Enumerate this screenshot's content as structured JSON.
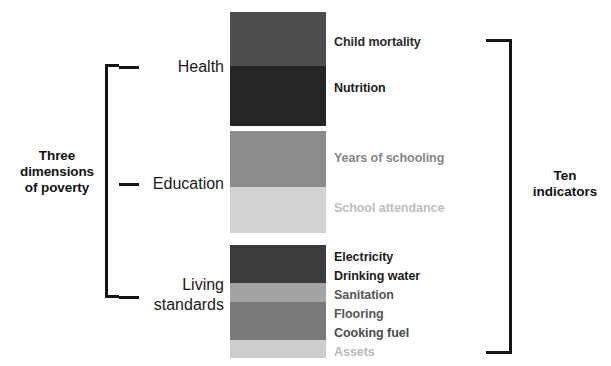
{
  "figure": {
    "background": "#ffffff"
  },
  "left_label": "Three\ndimensions\nof poverty",
  "right_label": "Ten\nindicators",
  "dimensions": [
    {
      "name": "Health",
      "label": "Health"
    },
    {
      "name": "Education",
      "label": "Education"
    },
    {
      "name": "Living standards",
      "label": "Living\nstandards"
    }
  ],
  "blocks": {
    "health": [
      {
        "indicator": "Child mortality",
        "color": "#4d4d4d",
        "height_px": 54
      },
      {
        "indicator": "Nutrition",
        "color": "#262626",
        "height_px": 60
      }
    ],
    "education": [
      {
        "indicator": "Years of schooling",
        "color": "#8c8c8c",
        "height_px": 56
      },
      {
        "indicator": "School attendance",
        "color": "#d2d2d2",
        "height_px": 46
      }
    ],
    "living_standards": [
      {
        "indicator": "Electricity",
        "color": "#3b3b3b",
        "height_px": 19
      },
      {
        "indicator": "Drinking water",
        "color": "#3b3b3b",
        "height_px": 19
      },
      {
        "indicator": "Sanitation",
        "color": "#a3a3a3",
        "height_px": 19
      },
      {
        "indicator": "Flooring",
        "color": "#7a7a7a",
        "height_px": 19
      },
      {
        "indicator": "Cooking fuel",
        "color": "#7a7a7a",
        "height_px": 19
      },
      {
        "indicator": "Assets",
        "color": "#cdcdcd",
        "height_px": 18
      }
    ]
  },
  "indicator_labels": [
    {
      "text": "Child mortality",
      "color": "#2b2b2b",
      "top": 35
    },
    {
      "text": "Nutrition",
      "color": "#1c1c1c",
      "top": 81
    },
    {
      "text": "Years of schooling",
      "color": "#868686",
      "top": 151
    },
    {
      "text": "School attendance",
      "color": "#bdbdbd",
      "top": 201
    },
    {
      "text": "Electricity",
      "color": "#1c1c1c",
      "top": 250
    },
    {
      "text": "Drinking water",
      "color": "#1c1c1c",
      "top": 269
    },
    {
      "text": "Sanitation",
      "color": "#555555",
      "top": 288
    },
    {
      "text": "Flooring",
      "color": "#555555",
      "top": 307
    },
    {
      "text": "Cooking fuel",
      "color": "#4a4a4a",
      "top": 326
    },
    {
      "text": "Assets",
      "color": "#b9b9b9",
      "top": 345
    }
  ],
  "colors": {
    "bracket": "#141414",
    "text_dark": "#121212",
    "background": "#ffffff"
  },
  "chart_data": {
    "type": "diagram",
    "groups": [
      {
        "dimension": "Health",
        "indicators": [
          "Child mortality",
          "Nutrition"
        ]
      },
      {
        "dimension": "Education",
        "indicators": [
          "Years of schooling",
          "School attendance"
        ]
      },
      {
        "dimension": "Living standards",
        "indicators": [
          "Electricity",
          "Drinking water",
          "Sanitation",
          "Flooring",
          "Cooking fuel",
          "Assets"
        ]
      }
    ],
    "dimension_count": 3,
    "indicator_count": 10
  }
}
